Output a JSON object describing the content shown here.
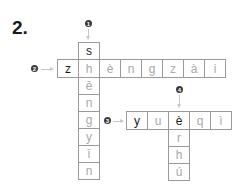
{
  "exercise": {
    "number_label": "2."
  },
  "clues": [
    {
      "id": "1",
      "direction": "down",
      "answer": "shēngyīn"
    },
    {
      "id": "2",
      "direction": "across",
      "answer": "zhèngzài"
    },
    {
      "id": "3",
      "direction": "across",
      "answer": "yuèqì"
    },
    {
      "id": "4",
      "direction": "down",
      "answer": "èrhú"
    }
  ],
  "grid": {
    "word1_down": [
      "s",
      "h",
      "ē",
      "n",
      "g",
      "y",
      "ī",
      "n"
    ],
    "word2_across": [
      "z",
      "h",
      "è",
      "n",
      "g",
      "z",
      "à",
      "i"
    ],
    "word3_across": [
      "y",
      "u",
      "è",
      "q",
      "ì"
    ],
    "word4_down": [
      "è",
      "r",
      "h",
      "ú"
    ]
  },
  "colors": {
    "given_letter": "#1a1a1a",
    "filled_letter": "#a9a9a9",
    "border": "#9a9a9a",
    "marker": "#3a3a3a",
    "arrow": "#c8c8c8"
  }
}
